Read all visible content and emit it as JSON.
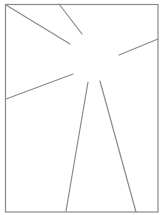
{
  "diagram": {
    "type": "line-drawing",
    "background": "#ffffff",
    "stroke_color": "#8a8a8a",
    "frame": {
      "x": 5.5,
      "y": 4.5,
      "width": 152.5,
      "height": 207.5,
      "stroke_width": 1.2
    },
    "rays": [
      {
        "id": "ray-top-left",
        "x1": 6,
        "y1": 5,
        "x2": 70,
        "y2": 44
      },
      {
        "id": "ray-top",
        "x1": 59,
        "y1": 4,
        "x2": 82,
        "y2": 34
      },
      {
        "id": "ray-right",
        "x1": 158,
        "y1": 39,
        "x2": 119,
        "y2": 55
      },
      {
        "id": "ray-left",
        "x1": 6,
        "y1": 99,
        "x2": 73,
        "y2": 74
      },
      {
        "id": "ray-bottom-left",
        "x1": 88,
        "y1": 82,
        "x2": 66,
        "y2": 211
      },
      {
        "id": "ray-bottom-right",
        "x1": 100,
        "y1": 81,
        "x2": 136,
        "y2": 212
      }
    ],
    "ray_stroke_width": 1.2
  }
}
